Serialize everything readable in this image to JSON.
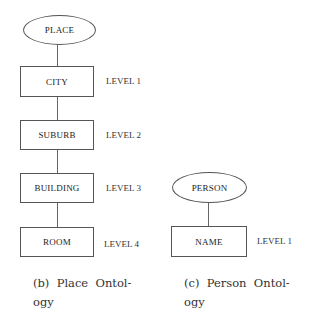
{
  "place_ontology": {
    "root": "PLACE",
    "nodes": [
      {
        "label": "CITY",
        "level": "LEVEL 1"
      },
      {
        "label": "SUBURB",
        "level": "LEVEL 2"
      },
      {
        "label": "BUILDING",
        "level": "LEVEL 3"
      },
      {
        "label": "ROOM",
        "level": "LEVEL 4"
      }
    ],
    "caption_line1": "(b)  Place  Ontol-",
    "caption_line2": "ogy"
  },
  "person_ontology": {
    "root": "PERSON",
    "nodes": [
      {
        "label": "NAME",
        "level": "LEVEL 1"
      }
    ],
    "caption_line1": "(c)  Person  Ontol-",
    "caption_line2": "ogy"
  }
}
